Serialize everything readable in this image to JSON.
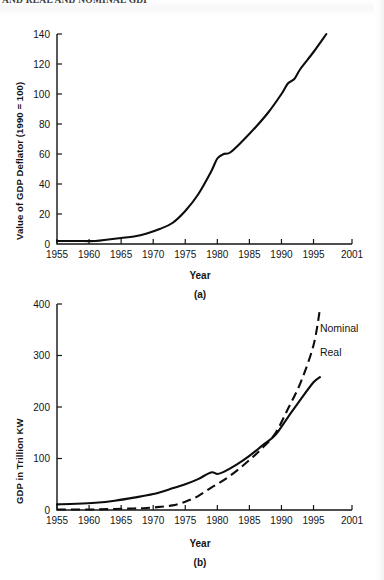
{
  "running_head": {
    "text": "AND REAL AND NOMINAL GDP"
  },
  "figures": {
    "a": {
      "caption": "(a)",
      "xlabel": "Year",
      "ylabel": "Value of GDP Deflator (1990 = 100)"
    },
    "b": {
      "caption": "(b)",
      "xlabel": "Year",
      "ylabel": "GDP in Trillion KW"
    }
  },
  "chart_data": [
    {
      "id": "a",
      "type": "line",
      "title": "",
      "xlabel": "Year",
      "ylabel": "Value of GDP Deflator (1990 = 100)",
      "xlim": [
        1955,
        2001
      ],
      "ylim": [
        0,
        140
      ],
      "xticks": [
        1955,
        1960,
        1965,
        1970,
        1975,
        1980,
        1985,
        1990,
        1995,
        2001
      ],
      "xtick_labels": [
        "1955",
        "1960",
        "1965",
        "1970",
        "1975",
        "1980",
        "1985",
        "1990",
        "1995",
        "2001"
      ],
      "yticks": [
        0,
        20,
        40,
        60,
        80,
        100,
        120,
        140
      ],
      "ytick_labels": [
        "0",
        "20",
        "40",
        "60",
        "80",
        "100",
        "120",
        "140"
      ],
      "grid": false,
      "legend": false,
      "series": [
        {
          "name": "GDP Deflator",
          "style": "solid",
          "x": [
            1955,
            1958,
            1961,
            1963,
            1965,
            1967,
            1969,
            1971,
            1973,
            1975,
            1977,
            1979,
            1980,
            1981,
            1982,
            1984,
            1986,
            1988,
            1990,
            1991,
            1992,
            1993,
            1995,
            1997
          ],
          "y": [
            2,
            2,
            2,
            3,
            4,
            5,
            7,
            10,
            14,
            22,
            33,
            48,
            57,
            60,
            61,
            69,
            78,
            88,
            100,
            107,
            110,
            117,
            128,
            140
          ]
        }
      ]
    },
    {
      "id": "b",
      "type": "line",
      "title": "",
      "xlabel": "Year",
      "ylabel": "GDP in Trillion KW",
      "xlim": [
        1955,
        2001
      ],
      "ylim": [
        0,
        400
      ],
      "xticks": [
        1955,
        1960,
        1965,
        1970,
        1975,
        1980,
        1985,
        1990,
        1995,
        2001
      ],
      "xtick_labels": [
        "1955",
        "1960",
        "1965",
        "1970",
        "1975",
        "1980",
        "1985",
        "1990",
        "1995",
        "2001"
      ],
      "yticks": [
        0,
        100,
        200,
        300,
        400
      ],
      "ytick_labels": [
        "0",
        "100",
        "200",
        "300",
        "400"
      ],
      "grid": false,
      "legend": true,
      "legend_position": "right-inline",
      "series": [
        {
          "name": "Real",
          "style": "solid",
          "label_x": 1996,
          "label_y": 300,
          "x": [
            1955,
            1958,
            1961,
            1964,
            1967,
            1970,
            1973,
            1975,
            1977,
            1979,
            1980,
            1981,
            1983,
            1985,
            1987,
            1989,
            1991,
            1993,
            1995,
            1996
          ],
          "y": [
            11,
            12,
            14,
            18,
            24,
            31,
            42,
            50,
            60,
            73,
            70,
            74,
            88,
            105,
            125,
            145,
            180,
            215,
            248,
            258
          ]
        },
        {
          "name": "Nominal",
          "style": "dashed",
          "label_x": 1996,
          "label_y": 345,
          "x": [
            1955,
            1960,
            1964,
            1967,
            1969,
            1971,
            1973,
            1975,
            1977,
            1979,
            1981,
            1983,
            1985,
            1987,
            1989,
            1991,
            1993,
            1995,
            1996
          ],
          "y": [
            1,
            1,
            2,
            3,
            4,
            6,
            9,
            16,
            27,
            43,
            58,
            76,
            97,
            120,
            148,
            196,
            248,
            320,
            390
          ]
        }
      ]
    }
  ]
}
